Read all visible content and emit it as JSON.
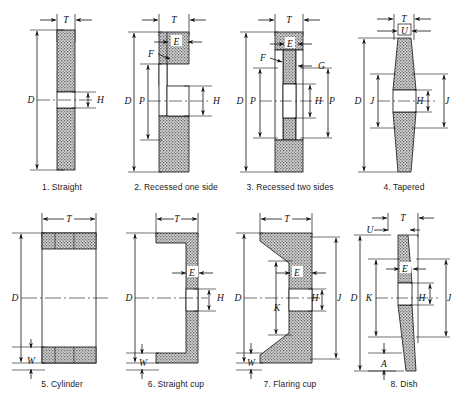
{
  "figure": {
    "type": "technical-line-diagram",
    "rows": 2,
    "columns": 4,
    "background_color": "#ffffff",
    "line_color": "#111111",
    "hatch_color": "#8f8f8f",
    "label_style": "italic-serif"
  },
  "shapes": [
    {
      "index": "1",
      "caption": "1. Straight",
      "labels": [
        "T",
        "D",
        "H"
      ],
      "dimensions": {
        "T": "wheel thickness",
        "D": "outside diameter",
        "H": "arbor hole diameter"
      }
    },
    {
      "index": "2",
      "caption": "2. Recessed one side",
      "labels": [
        "T",
        "E",
        "F",
        "D",
        "P",
        "H"
      ],
      "dimensions": {
        "T": "wheel thickness",
        "E": "back wall thickness",
        "F": "recess depth",
        "D": "outside diameter",
        "P": "recess diameter",
        "H": "arbor hole diameter"
      }
    },
    {
      "index": "3",
      "caption": "3. Recessed two sides",
      "labels": [
        "T",
        "E",
        "F",
        "G",
        "D",
        "P",
        "H",
        "P"
      ],
      "dimensions": {
        "T": "wheel thickness",
        "E": "web thickness",
        "F": "recess depth left",
        "G": "recess depth right",
        "D": "outside diameter",
        "P": "recess diameter",
        "H": "arbor hole diameter"
      }
    },
    {
      "index": "4",
      "caption": "4. Tapered",
      "labels": [
        "T",
        "U",
        "D",
        "J",
        "H",
        "J"
      ],
      "dimensions": {
        "T": "maximum thickness",
        "U": "rim thickness",
        "D": "outside diameter",
        "J": "taper flat diameter",
        "H": "arbor hole diameter"
      }
    },
    {
      "index": "5",
      "caption": "5. Cylinder",
      "labels": [
        "T",
        "D",
        "W"
      ],
      "dimensions": {
        "T": "wheel thickness",
        "D": "outside diameter",
        "W": "wall thickness"
      }
    },
    {
      "index": "6",
      "caption": "6. Straight cup",
      "labels": [
        "T",
        "E",
        "D",
        "H",
        "W"
      ],
      "dimensions": {
        "T": "wheel thickness",
        "E": "back thickness",
        "D": "outside diameter",
        "H": "arbor hole diameter",
        "W": "wall thickness"
      }
    },
    {
      "index": "7",
      "caption": "7. Flaring cup",
      "labels": [
        "T",
        "E",
        "D",
        "K",
        "H",
        "J",
        "W"
      ],
      "dimensions": {
        "T": "wheel thickness",
        "E": "back thickness",
        "D": "outside diameter",
        "K": "back diameter",
        "H": "arbor hole diameter",
        "J": "back flat diameter",
        "W": "wall thickness"
      }
    },
    {
      "index": "8",
      "caption": "8. Dish",
      "labels": [
        "T",
        "U",
        "E",
        "D",
        "K",
        "H",
        "J",
        "A"
      ],
      "dimensions": {
        "T": "wheel thickness",
        "U": "rim thickness",
        "E": "back thickness",
        "D": "outside diameter",
        "K": "back diameter",
        "H": "arbor hole diameter",
        "J": "back flat diameter",
        "A": "rim depth"
      }
    }
  ]
}
